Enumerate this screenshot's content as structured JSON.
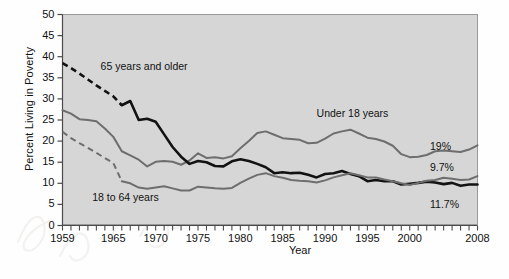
{
  "chart_data": {
    "type": "line",
    "title": "",
    "xlabel": "Year",
    "ylabel": "Percent Living in Poverty",
    "xlim": [
      1959,
      2008
    ],
    "ylim": [
      0,
      50
    ],
    "yticks": [
      0,
      5,
      10,
      15,
      20,
      25,
      30,
      35,
      40,
      45,
      50
    ],
    "xticks_labeled": [
      1959,
      1965,
      1970,
      1975,
      1980,
      1985,
      1990,
      1995,
      2000,
      2008
    ],
    "xtick_interval_minor": 1,
    "grid": false,
    "legend_position": "inline-annotations",
    "colors": {
      "under18": "#6e6e6e",
      "age18to64": "#6e6e6e",
      "age65plus": "#121212",
      "plot_background": "#d6d6d6",
      "axis": "#4a4a4a",
      "text": "#111111"
    },
    "annotations": [
      {
        "name": "65 years and older",
        "text": "65 years and older",
        "x": 1963.5,
        "y": 37.5
      },
      {
        "name": "Under 18 years",
        "text": "Under 18 years",
        "x": 1989.0,
        "y": 26.5
      },
      {
        "name": "18 to 64 years",
        "text": "18 to 64 years",
        "x": 1962.5,
        "y": 6.5
      }
    ],
    "end_labels": [
      {
        "series": "Under 18 years",
        "text": "19%",
        "value": 19.0,
        "year": 2008
      },
      {
        "series": "65 years and older",
        "text": "9.7%",
        "value": 9.7,
        "year": 2008
      },
      {
        "series": "18 to 64 years",
        "text": "11.7%",
        "value": 11.7,
        "year": 2008
      }
    ],
    "series": [
      {
        "name": "Under 18 years",
        "color": "#6e6e6e",
        "style": "solid",
        "x": [
          1959,
          1960,
          1961,
          1962,
          1963,
          1964,
          1965,
          1966,
          1967,
          1968,
          1969,
          1970,
          1971,
          1972,
          1973,
          1974,
          1975,
          1976,
          1977,
          1978,
          1979,
          1980,
          1981,
          1982,
          1983,
          1984,
          1985,
          1986,
          1987,
          1988,
          1989,
          1990,
          1991,
          1992,
          1993,
          1994,
          1995,
          1996,
          1997,
          1998,
          1999,
          2000,
          2001,
          2002,
          2003,
          2004,
          2005,
          2006,
          2007,
          2008
        ],
        "values": [
          27.3,
          26.5,
          25.2,
          25.0,
          24.7,
          23.0,
          21.0,
          17.6,
          16.6,
          15.6,
          14.0,
          15.1,
          15.3,
          15.1,
          14.4,
          15.4,
          17.1,
          16.0,
          16.2,
          15.9,
          16.4,
          18.3,
          20.0,
          21.9,
          22.3,
          21.5,
          20.7,
          20.5,
          20.3,
          19.5,
          19.6,
          20.6,
          21.8,
          22.3,
          22.7,
          21.8,
          20.8,
          20.5,
          19.9,
          18.9,
          16.9,
          16.2,
          16.3,
          16.7,
          17.6,
          17.8,
          17.6,
          17.4,
          18.0,
          19.0
        ]
      },
      {
        "name": "65 years and older",
        "color": "#121212",
        "style": "dashed-then-solid",
        "dash_until_year": 1966,
        "x": [
          1959,
          1960,
          1961,
          1962,
          1963,
          1964,
          1965,
          1966,
          1967,
          1968,
          1969,
          1970,
          1971,
          1972,
          1973,
          1974,
          1975,
          1976,
          1977,
          1978,
          1979,
          1980,
          1981,
          1982,
          1983,
          1984,
          1985,
          1986,
          1987,
          1988,
          1989,
          1990,
          1991,
          1992,
          1993,
          1994,
          1995,
          1996,
          1997,
          1998,
          1999,
          2000,
          2001,
          2002,
          2003,
          2004,
          2005,
          2006,
          2007,
          2008
        ],
        "values": [
          38.5,
          37.3,
          36.0,
          34.6,
          33.2,
          31.9,
          30.6,
          28.5,
          29.5,
          25.0,
          25.3,
          24.6,
          21.6,
          18.6,
          16.3,
          14.6,
          15.3,
          15.0,
          14.1,
          14.0,
          15.2,
          15.7,
          15.3,
          14.6,
          13.8,
          12.4,
          12.6,
          12.4,
          12.5,
          12.0,
          11.4,
          12.2,
          12.4,
          12.9,
          12.2,
          11.7,
          10.5,
          10.8,
          10.5,
          10.5,
          9.7,
          9.9,
          10.1,
          10.4,
          10.2,
          9.8,
          10.1,
          9.4,
          9.7,
          9.7
        ]
      },
      {
        "name": "18 to 64 years",
        "color": "#6e6e6e",
        "style": "dashed-then-solid",
        "dash_until_year": 1966,
        "x": [
          1959,
          1960,
          1961,
          1962,
          1963,
          1964,
          1965,
          1966,
          1967,
          1968,
          1969,
          1970,
          1971,
          1972,
          1973,
          1974,
          1975,
          1976,
          1977,
          1978,
          1979,
          1980,
          1981,
          1982,
          1983,
          1984,
          1985,
          1986,
          1987,
          1988,
          1989,
          1990,
          1991,
          1992,
          1993,
          1994,
          1995,
          1996,
          1997,
          1998,
          1999,
          2000,
          2001,
          2002,
          2003,
          2004,
          2005,
          2006,
          2007,
          2008
        ],
        "values": [
          22.2,
          20.7,
          19.5,
          18.4,
          17.2,
          16.0,
          14.8,
          10.5,
          10.0,
          9.0,
          8.7,
          9.0,
          9.3,
          8.8,
          8.3,
          8.3,
          9.2,
          9.0,
          8.8,
          8.7,
          8.9,
          10.1,
          11.1,
          12.0,
          12.4,
          11.7,
          11.3,
          10.8,
          10.6,
          10.5,
          10.2,
          10.7,
          11.4,
          11.9,
          12.4,
          11.9,
          11.4,
          11.4,
          10.9,
          10.5,
          10.0,
          9.6,
          10.1,
          10.6,
          10.8,
          11.3,
          11.1,
          10.8,
          10.9,
          11.7
        ]
      }
    ]
  },
  "axis": {
    "ytick_labels": [
      "50",
      "45",
      "40",
      "35",
      "30",
      "25",
      "20",
      "15",
      "10",
      "5",
      "0"
    ],
    "xtick_labels": [
      "1959",
      "1965",
      "1970",
      "1975",
      "1980",
      "1985",
      "1990",
      "1995",
      "2000",
      "2008"
    ]
  }
}
